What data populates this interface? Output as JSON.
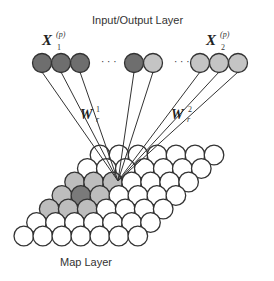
{
  "labels": {
    "top_title": "Input/Output Layer",
    "bottom_title": "Map Layer",
    "x1": "X",
    "x1_sub": "1",
    "x1_sup": "(p)",
    "x2": "X",
    "x2_sub": "2",
    "x2_sup": "(p)",
    "w1": "W",
    "w1_sup": "1",
    "w1_sub": "r",
    "w2": "W",
    "w2_sup": "2",
    "w2_sub": "r",
    "ellipsis_left": "· · ·",
    "ellipsis_right": "· · ·"
  },
  "colors": {
    "dark_node": "#6e6e6e",
    "light_node": "#c4c4c4",
    "winner_node": "#7a7a7a",
    "neighbor_node": "#bdbdbd",
    "empty_node": "#ffffff",
    "stroke": "#333333"
  },
  "input_nodes": [
    {
      "x": 42,
      "y": 63,
      "shade": "dark"
    },
    {
      "x": 61,
      "y": 63,
      "shade": "dark"
    },
    {
      "x": 80,
      "y": 63,
      "shade": "dark"
    },
    {
      "x": 134,
      "y": 63,
      "shade": "dark"
    },
    {
      "x": 153,
      "y": 63,
      "shade": "light"
    },
    {
      "x": 200,
      "y": 63,
      "shade": "light"
    },
    {
      "x": 219,
      "y": 63,
      "shade": "light"
    },
    {
      "x": 238,
      "y": 63,
      "shade": "light"
    }
  ],
  "map_grid": {
    "rows": 7,
    "cols": 7,
    "origin_x": 100,
    "origin_y": 155,
    "col_dx": 19,
    "row_dx": -12.7,
    "row_dy": 13.5,
    "radius": 9.8
  },
  "winner": {
    "x": 118,
    "y": 181
  },
  "shaded_cells": [
    {
      "r": 2,
      "c": 0,
      "shade": "neighbor"
    },
    {
      "r": 2,
      "c": 1,
      "shade": "neighbor"
    },
    {
      "r": 2,
      "c": 2,
      "shade": "neighbor"
    },
    {
      "r": 3,
      "c": 0,
      "shade": "neighbor"
    },
    {
      "r": 3,
      "c": 1,
      "shade": "winner"
    },
    {
      "r": 3,
      "c": 2,
      "shade": "neighbor"
    },
    {
      "r": 4,
      "c": 0,
      "shade": "neighbor"
    },
    {
      "r": 4,
      "c": 1,
      "shade": "neighbor"
    },
    {
      "r": 4,
      "c": 2,
      "shade": "neighbor"
    }
  ]
}
